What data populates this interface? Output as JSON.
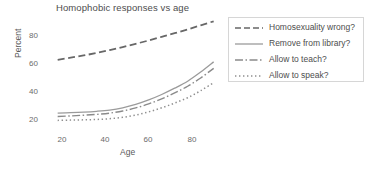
{
  "chart_data": {
    "type": "line",
    "title": "Homophobic responses vs age",
    "xlabel": "Age",
    "ylabel": "Percent",
    "xlim": [
      14,
      94
    ],
    "ylim": [
      14,
      94
    ],
    "xticks": [
      20,
      40,
      60,
      80
    ],
    "yticks": [
      20,
      40,
      60,
      80
    ],
    "grid": false,
    "legend_position": "right",
    "x": [
      18,
      24,
      30,
      36,
      42,
      48,
      54,
      60,
      66,
      72,
      78,
      84,
      90
    ],
    "series": [
      {
        "name": "Homosexuality wrong?",
        "style": "dashed",
        "color": "#676767",
        "values": [
          62.3,
          63.8,
          65.4,
          67.2,
          69.2,
          71.4,
          73.7,
          76.1,
          78.7,
          81.3,
          84.0,
          86.9,
          89.8
        ]
      },
      {
        "name": "Remove from library?",
        "style": "solid",
        "color": "#9b9b9b",
        "values": [
          24.2,
          24.5,
          24.9,
          25.5,
          26.4,
          28.0,
          30.4,
          33.6,
          37.5,
          42.0,
          47.0,
          53.5,
          60.8
        ]
      },
      {
        "name": "Allow to teach?",
        "style": "dashdot",
        "color": "#8a8a8a",
        "values": [
          21.8,
          22.2,
          22.7,
          23.3,
          24.2,
          25.7,
          27.9,
          30.8,
          34.4,
          38.6,
          43.4,
          49.3,
          56.2
        ]
      },
      {
        "name": "Allow to speak?",
        "style": "dotted",
        "color": "#8f8f8f",
        "values": [
          19.0,
          19.2,
          19.4,
          19.7,
          20.2,
          21.2,
          22.8,
          25.1,
          28.0,
          31.4,
          35.2,
          40.2,
          46.0
        ]
      }
    ]
  },
  "legend": {
    "entries": [
      {
        "label": "Homosexuality wrong?"
      },
      {
        "label": "Remove from library?"
      },
      {
        "label": "Allow to teach?"
      },
      {
        "label": "Allow to speak?"
      }
    ]
  },
  "axes": {
    "ytick_labels": [
      "80",
      "60",
      "40",
      "20"
    ],
    "xtick_labels": [
      "20",
      "40",
      "60",
      "80"
    ]
  }
}
